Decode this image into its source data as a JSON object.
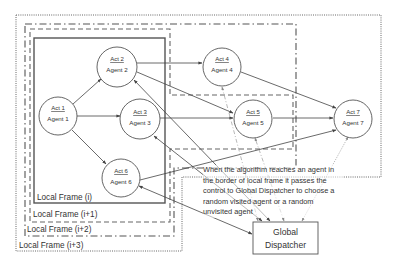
{
  "frames": [
    {
      "id": "frame-i",
      "label": "Local Frame (i)",
      "style": "solid"
    },
    {
      "id": "frame-i1",
      "label": "Local Frame (i+1)",
      "style": "dashed"
    },
    {
      "id": "frame-i2",
      "label": "Local Frame (i+2)",
      "style": "dash-dot"
    },
    {
      "id": "frame-i3",
      "label": "Local Frame (i+3)",
      "style": "dotted"
    }
  ],
  "nodes": [
    {
      "id": "n1",
      "act": "Act 1",
      "agent": "Agent 1"
    },
    {
      "id": "n2",
      "act": "Act 2",
      "agent": "Agent 2"
    },
    {
      "id": "n3",
      "act": "Act 3",
      "agent": "Agent 3"
    },
    {
      "id": "n4",
      "act": "Act 4",
      "agent": "Agent 4"
    },
    {
      "id": "n5",
      "act": "Act 5",
      "agent": "Agent 5"
    },
    {
      "id": "n6",
      "act": "Act 6",
      "agent": "Agent 6"
    },
    {
      "id": "n7",
      "act": "Act 7",
      "agent": "Agent 7"
    }
  ],
  "dispatcher": {
    "line1": "Global",
    "line2": "Dispatcher"
  },
  "note": "When the algorithm reaches an agent in the border of local frame it passes the control to Global Dispatcher to choose a random visited agent or a random unvisited agent",
  "edges": [
    {
      "from": "Act 1",
      "to": "Act 2"
    },
    {
      "from": "Act 1",
      "to": "Act 3"
    },
    {
      "from": "Act 1",
      "to": "Act 6"
    },
    {
      "from": "Act 2",
      "to": "Act 4"
    },
    {
      "from": "Act 2",
      "to": "Act 5"
    },
    {
      "from": "Act 3",
      "to": "Act 5"
    },
    {
      "from": "Act 4",
      "to": "Act 7"
    },
    {
      "from": "Act 5",
      "to": "Act 7"
    },
    {
      "from": "Act 6",
      "to": "Act 7"
    },
    {
      "from": "Global Dispatcher",
      "to": "Act 2",
      "bidirectional": true
    },
    {
      "from": "Global Dispatcher",
      "to": "Act 3",
      "bidirectional": true
    },
    {
      "from": "Global Dispatcher",
      "to": "Act 6",
      "bidirectional": true
    },
    {
      "from": "Global Dispatcher",
      "to": "Act 4",
      "style": "dash-dot"
    },
    {
      "from": "Global Dispatcher",
      "to": "Act 5",
      "style": "dash-dot"
    },
    {
      "from": "Global Dispatcher",
      "to": "Act 7",
      "style": "dotted"
    }
  ],
  "colors": {
    "line": "#444444",
    "frame": "#555555",
    "light_line": "#999999"
  }
}
